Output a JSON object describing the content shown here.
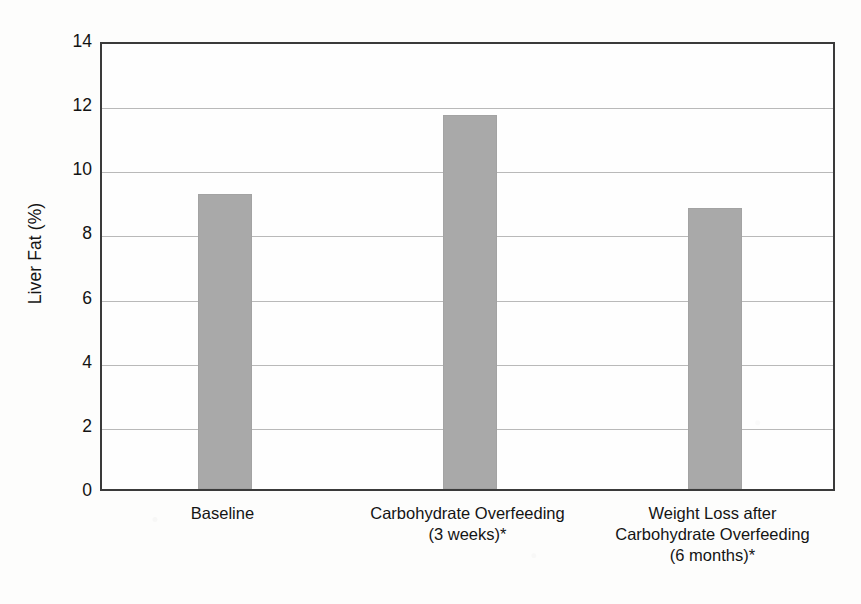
{
  "chart_data": {
    "type": "bar",
    "title": "",
    "subtitle": "",
    "xlabel": "",
    "ylabel": "Liver Fat (%)",
    "ylim": [
      0,
      14
    ],
    "ytick_step": 2,
    "yticks": [
      0,
      2,
      4,
      6,
      8,
      10,
      12,
      14
    ],
    "ytick_labels": [
      "0",
      "2",
      "4",
      "6",
      "8",
      "10",
      "12",
      "14"
    ],
    "grid": true,
    "grid_axis": "y",
    "legend": false,
    "legend_position": "none",
    "bar_color": "#a9a9a9",
    "axis_color": "#3a3a3a",
    "grid_color": "#b9b9b9",
    "categories": [
      "Baseline",
      "Carbohydrate Overfeeding (3 weeks)*",
      "Weight Loss after Carbohydrate Overfeeding (6 months)*"
    ],
    "category_label_lines": [
      [
        "Baseline"
      ],
      [
        "Carbohydrate Overfeeding",
        "(3 weeks)*"
      ],
      [
        "Weight Loss after",
        "Carbohydrate Overfeeding",
        "(6 months)*"
      ]
    ],
    "values": [
      9.2,
      11.65,
      8.75
    ],
    "annotations": [
      "* denotes significance marker on category label"
    ]
  }
}
